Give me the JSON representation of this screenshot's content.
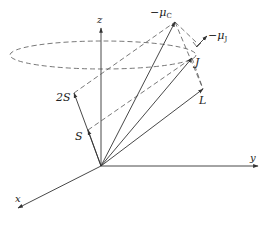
{
  "diagram": {
    "colors": {
      "line": "#333333",
      "dashed": "#555555",
      "background": "#ffffff"
    },
    "origin": {
      "x": 101,
      "y": 166
    },
    "axes": [
      {
        "name": "z",
        "label": "z",
        "end": {
          "x": 101,
          "y": 28
        },
        "label_pos": {
          "x": 97,
          "y": 23
        }
      },
      {
        "name": "y",
        "label": "y",
        "end": {
          "x": 258,
          "y": 166
        },
        "label_pos": {
          "x": 250,
          "y": 161
        }
      },
      {
        "name": "x",
        "label": "x",
        "end": {
          "x": 18,
          "y": 208
        },
        "label_pos": {
          "x": 15,
          "y": 202
        }
      }
    ],
    "vectors": [
      {
        "name": "S",
        "label": "S",
        "tip": {
          "x": 88,
          "y": 130
        },
        "label_pos": {
          "x": 75,
          "y": 140
        }
      },
      {
        "name": "2S",
        "label": "2S",
        "tip": {
          "x": 74,
          "y": 93
        },
        "label_pos": {
          "x": 56,
          "y": 101
        }
      },
      {
        "name": "L",
        "label": "L",
        "tip": {
          "x": 203,
          "y": 89
        },
        "label_pos": {
          "x": 199,
          "y": 104
        }
      },
      {
        "name": "J",
        "label": "J",
        "tip": {
          "x": 192,
          "y": 58
        },
        "label_pos": {
          "x": 195,
          "y": 66
        }
      },
      {
        "name": "mu_C",
        "label": "−μ",
        "sub": "C",
        "tip": {
          "x": 175,
          "y": 22
        },
        "label_pos": {
          "x": 150,
          "y": 16
        }
      },
      {
        "name": "mu_J",
        "label": "−μ",
        "sub": "J",
        "tip": {
          "x": 207,
          "y": 36
        },
        "label_pos": {
          "x": 210,
          "y": 39
        }
      }
    ],
    "precession_ellipse": {
      "cx": 103,
      "cy": 55,
      "rx": 93,
      "ry": 14
    }
  }
}
